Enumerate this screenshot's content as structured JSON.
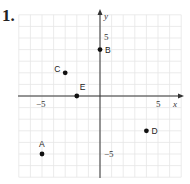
{
  "problem": {
    "number": "1."
  },
  "chart_data": {
    "type": "scatter",
    "title": "",
    "xlabel": "x",
    "ylabel": "y",
    "xlim": [
      -7,
      7
    ],
    "ylim": [
      -7,
      7
    ],
    "grid": true,
    "tick_labels": {
      "x": [
        "-5",
        "5"
      ],
      "y": [
        "5",
        "-5"
      ]
    },
    "tick_label_text": {
      "x_neg": "−5",
      "x_pos": "5",
      "y_pos": "5",
      "y_neg": "−5"
    },
    "points": [
      {
        "label": "A",
        "x": -5,
        "y": -5
      },
      {
        "label": "B",
        "x": 0,
        "y": 4
      },
      {
        "label": "C",
        "x": -3,
        "y": 2
      },
      {
        "label": "D",
        "x": 4,
        "y": -3
      },
      {
        "label": "E",
        "x": -2,
        "y": 0
      }
    ]
  },
  "colors": {
    "grid": "#e6e6e6",
    "axis": "#333333",
    "point": "#111111"
  }
}
